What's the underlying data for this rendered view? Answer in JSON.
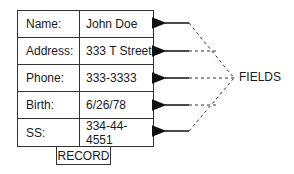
{
  "diagram": {
    "record_label": "RECORD",
    "fields_label": "FIELDS",
    "rows": [
      {
        "label": "Name:",
        "value": "John Doe"
      },
      {
        "label": "Address:",
        "value": "333 T Street"
      },
      {
        "label": "Phone:",
        "value": "333-3333"
      },
      {
        "label": "Birth:",
        "value": "6/26/78"
      },
      {
        "label": "SS:",
        "value": "334-44-4551"
      }
    ]
  }
}
